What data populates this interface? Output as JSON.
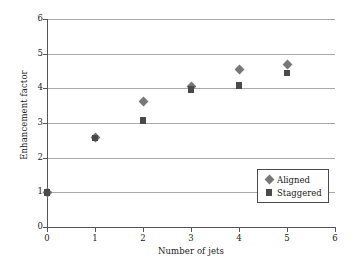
{
  "chart_data": {
    "type": "scatter",
    "title": "",
    "xlabel": "Number of jets",
    "ylabel": "Enhancement factor",
    "xlim": [
      0,
      6
    ],
    "ylim": [
      0,
      6
    ],
    "xticks": [
      "0",
      "1",
      "2",
      "3",
      "4",
      "5",
      "6"
    ],
    "yticks": [
      "0",
      "1",
      "2",
      "3",
      "4",
      "5",
      "6"
    ],
    "grid": "horizontal",
    "legend_position": "lower-right-inside",
    "series": [
      {
        "name": "Aligned",
        "marker": "diamond",
        "color": "#777777",
        "x": [
          0,
          1,
          2,
          3,
          4,
          5
        ],
        "values": [
          1.0,
          2.57,
          3.63,
          4.06,
          4.55,
          4.68
        ]
      },
      {
        "name": "Staggered",
        "marker": "square",
        "color": "#4a4a4a",
        "x": [
          0,
          1,
          2,
          3,
          4,
          5
        ],
        "values": [
          1.0,
          2.57,
          3.07,
          3.96,
          4.08,
          4.44
        ]
      }
    ]
  },
  "axes": {
    "axis_color": "#555555",
    "grid_color": "#a9a9a9"
  },
  "legend": {
    "entries": [
      {
        "label": "Aligned"
      },
      {
        "label": "Staggered"
      }
    ]
  }
}
